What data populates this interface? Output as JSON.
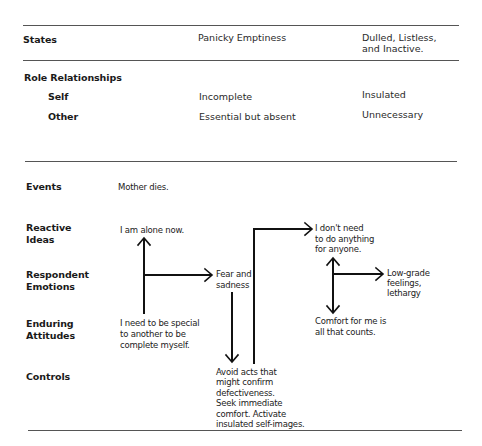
{
  "table_top": {
    "states": {
      "label": "States",
      "col1": "Panicky Emptiness",
      "col2_line1": "Dulled, Listless,",
      "col2_line2": "and Inactive."
    },
    "role_relationships": {
      "label": "Role Relationships",
      "self": {
        "label": "Self",
        "col1": "Incomplete",
        "col2": "Insulated"
      },
      "other": {
        "label": "Other",
        "col1": "Essential but absent",
        "col2": "Unnecessary"
      }
    }
  },
  "diagram": {
    "rows": {
      "events": "Events",
      "reactive_ideas_1": "Reactive",
      "reactive_ideas_2": "Ideas",
      "respondent_emotions_1": "Respondent",
      "respondent_emotions_2": "Emotions",
      "enduring_attitudes_1": "Enduring",
      "enduring_attitudes_2": "Attitudes",
      "controls": "Controls"
    },
    "nodes": {
      "mother_dies": "Mother dies.",
      "alone_now": "I am alone now.",
      "fear_sadness_1": "Fear and",
      "fear_sadness_2": "sadness",
      "need_special": [
        "I need to be special",
        "to another to be",
        "complete myself."
      ],
      "dont_need": [
        "I don't need",
        "to do anything",
        "for anyone."
      ],
      "low_grade": [
        "Low-grade",
        "feelings,",
        "lethargy"
      ],
      "comfort": [
        "Comfort for me is",
        "all that counts."
      ],
      "avoid_acts": [
        "Avoid acts that",
        "might confirm",
        "defectiveness.",
        "Seek immediate",
        "comfort. Activate",
        "insulated self-images."
      ]
    },
    "line_color": "#111111"
  }
}
